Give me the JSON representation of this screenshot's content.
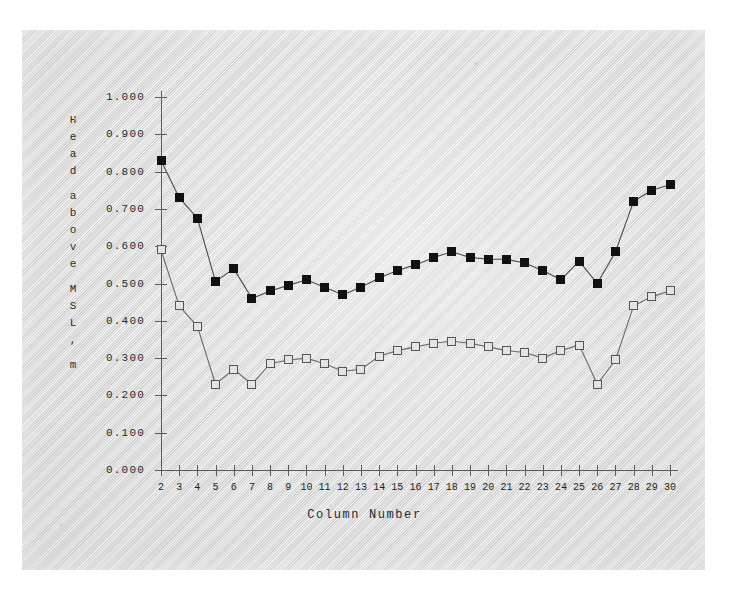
{
  "chart_data": {
    "type": "line",
    "title": "",
    "xlabel": "Column Number",
    "ylabel": "Head above MSL, m",
    "xlim": [
      2,
      30
    ],
    "ylim": [
      0.0,
      1.0
    ],
    "grid": false,
    "legend": "none",
    "ytick_labels": [
      "1.000",
      "0.900",
      "0.800",
      "0.700",
      "0.600",
      "0.500",
      "0.400",
      "0.300",
      "0.200",
      "0.100",
      "0.000"
    ],
    "ytick_values": [
      1.0,
      0.9,
      0.8,
      0.7,
      0.6,
      0.5,
      0.4,
      0.3,
      0.2,
      0.1,
      0.0
    ],
    "xtick_labels": [
      "2",
      "3",
      "4",
      "5",
      "6",
      "7",
      "8",
      "9",
      "10",
      "11",
      "12",
      "13",
      "14",
      "15",
      "16",
      "17",
      "18",
      "19",
      "20",
      "21",
      "22",
      "23",
      "24",
      "25",
      "26",
      "27",
      "28",
      "29",
      "30"
    ],
    "x": [
      2,
      3,
      4,
      5,
      6,
      7,
      8,
      9,
      10,
      11,
      12,
      13,
      14,
      15,
      16,
      17,
      18,
      19,
      20,
      21,
      22,
      23,
      24,
      25,
      26,
      27,
      28,
      29,
      30
    ],
    "series": [
      {
        "name": "filled-square-series",
        "marker": "filled-square",
        "color": "#111111",
        "values": [
          0.83,
          0.73,
          0.675,
          0.505,
          0.54,
          0.46,
          0.48,
          0.495,
          0.51,
          0.49,
          0.47,
          0.49,
          0.515,
          0.535,
          0.55,
          0.57,
          0.585,
          0.57,
          0.565,
          0.565,
          0.555,
          0.535,
          0.51,
          0.56,
          0.5,
          0.585,
          0.72,
          0.75,
          0.765
        ]
      },
      {
        "name": "open-square-series",
        "marker": "open-square",
        "color": "#6b6b6b",
        "values": [
          0.59,
          0.44,
          0.385,
          0.23,
          0.27,
          0.23,
          0.285,
          0.295,
          0.3,
          0.285,
          0.265,
          0.27,
          0.305,
          0.32,
          0.33,
          0.34,
          0.345,
          0.34,
          0.33,
          0.32,
          0.315,
          0.3,
          0.32,
          0.335,
          0.23,
          0.295,
          0.44,
          0.465,
          0.48
        ]
      }
    ]
  },
  "figure": {
    "background_color": "#e4e4e4",
    "page_color": "#ffffff",
    "axis_color": "#5c5c5c"
  }
}
